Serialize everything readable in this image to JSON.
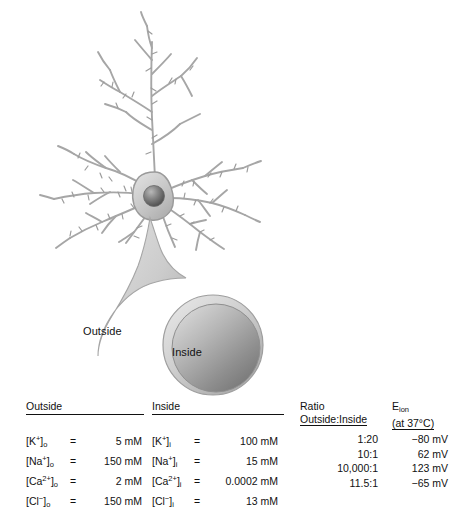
{
  "figure": {
    "background_color": "#ffffff"
  },
  "diagram": {
    "neuron": {
      "name": "pyramidal-neuron",
      "soma_color": "#c9c9c9",
      "nucleus_color": "#6e6e6e",
      "dendrite_color": "#b0b0b0",
      "outline_color": "#8d8d8d"
    },
    "magnified_cell": {
      "name": "magnified-cell-body",
      "membrane_color": "#c8c8c8",
      "cytoplasm_light": "#cfcfcf",
      "cytoplasm_dark": "#7b7b7b"
    },
    "labels": {
      "outside": "Outside",
      "inside": "Inside"
    }
  },
  "table": {
    "headers": {
      "outside": "Outside",
      "inside": "Inside",
      "ratio_line1": "Ratio",
      "ratio_line2": "Outside:Inside",
      "eion_main": "E",
      "eion_sub": "ion",
      "eion_condition": "(at 37°C)"
    },
    "rows": [
      {
        "ion": "K",
        "charge": "+",
        "outside_sub": "o",
        "inside_sub": "i",
        "outside_eq": "=",
        "outside_value": "5 mM",
        "inside_eq": "=",
        "inside_value": "100 mM",
        "ratio": "1:20",
        "eion": "−80 mV"
      },
      {
        "ion": "Na",
        "charge": "+",
        "outside_sub": "o",
        "inside_sub": "i",
        "outside_eq": "=",
        "outside_value": "150 mM",
        "inside_eq": "=",
        "inside_value": "15 mM",
        "ratio": "10:1",
        "eion": "62 mV"
      },
      {
        "ion": "Ca",
        "charge": "2+",
        "outside_sub": "o",
        "inside_sub": "i",
        "outside_eq": "=",
        "outside_value": "2 mM",
        "inside_eq": "=",
        "inside_value": "0.0002 mM",
        "ratio": "10,000:1",
        "eion": "123 mV"
      },
      {
        "ion": "Cl",
        "charge": "−",
        "outside_sub": "o",
        "inside_sub": "i",
        "outside_eq": "=",
        "outside_value": "150 mM",
        "inside_eq": "=",
        "inside_value": "13 mM",
        "ratio": "11.5:1",
        "eion": "−65 mV"
      }
    ]
  }
}
